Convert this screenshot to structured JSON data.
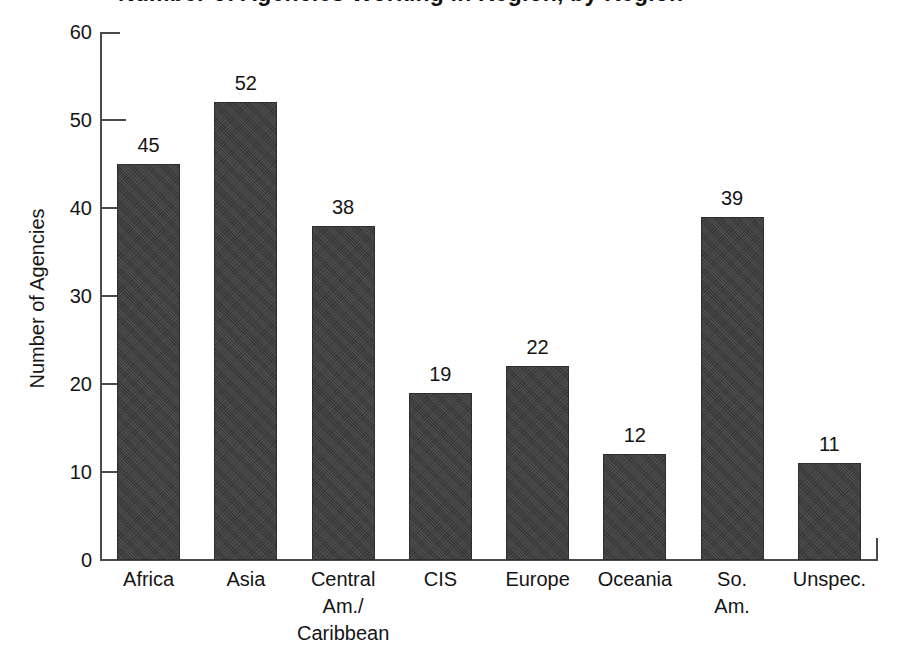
{
  "chart_data": {
    "type": "bar",
    "title": "Number of Agencies Working in Region, by Region",
    "xlabel": "",
    "ylabel": "Number of Agencies",
    "categories": [
      "Africa",
      "Asia",
      "Central Am./Caribbean",
      "CIS",
      "Europe",
      "Oceania",
      "So. Am.",
      "Unspec."
    ],
    "category_lines": [
      [
        "Africa"
      ],
      [
        "Asia"
      ],
      [
        "Central",
        "Am./",
        "Caribbean"
      ],
      [
        "CIS"
      ],
      [
        "Europe"
      ],
      [
        "Oceania"
      ],
      [
        "So.",
        "Am."
      ],
      [
        "Unspec."
      ]
    ],
    "values": [
      45,
      52,
      38,
      19,
      22,
      12,
      39,
      11
    ],
    "ylim": [
      0,
      60
    ],
    "ytick_labels": [
      "0",
      "10",
      "20",
      "30",
      "40",
      "50",
      "60"
    ],
    "ytick_values": [
      0,
      10,
      20,
      30,
      40,
      50,
      60
    ],
    "grid": false,
    "legend": "none",
    "bar_color": "#3d3d3d",
    "axis_color": "#4a4a4a",
    "background_color": "#ffffff",
    "data_labels_shown": true
  }
}
